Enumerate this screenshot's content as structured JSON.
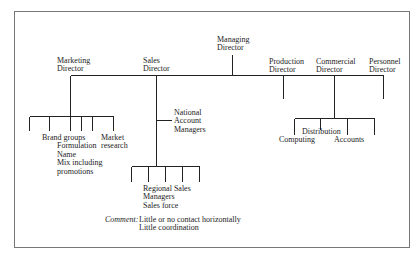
{
  "diagram": {
    "type": "organization-chart",
    "root": {
      "label": [
        "Managing",
        "Director"
      ]
    },
    "directors": [
      {
        "id": "marketing",
        "label": [
          "Marketing",
          "Director"
        ]
      },
      {
        "id": "sales",
        "label": [
          "Sales",
          "Director"
        ]
      },
      {
        "id": "production",
        "label": [
          "Production",
          "Director"
        ]
      },
      {
        "id": "commercial",
        "label": [
          "Commercial",
          "Director"
        ]
      },
      {
        "id": "personnel",
        "label": [
          "Personnel",
          "Director"
        ]
      }
    ],
    "marketing_children": {
      "brand_groups": [
        "Brand groups",
        "Formulation",
        "Name",
        "Mix including",
        "promotions"
      ],
      "market_research": [
        "Market",
        "research"
      ]
    },
    "sales_children": {
      "national_accounts": [
        "National",
        "Account",
        "Managers"
      ],
      "regional": [
        "Regional Sales",
        "Managers",
        "Sales force"
      ]
    },
    "commercial_children": {
      "distribution": "Distribution",
      "computing": "Computing",
      "accounts": "Accounts"
    },
    "comment": {
      "label": "Comment:",
      "lines": [
        "Little or no contact horizontally",
        "Little coordination"
      ]
    },
    "line_color": "#222222",
    "frame_color": "#777777"
  }
}
